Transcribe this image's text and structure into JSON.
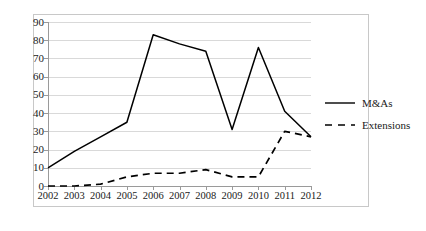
{
  "chart_data": {
    "type": "line",
    "title": "",
    "subtitle": "",
    "xlabel": "",
    "ylabel": "",
    "categories": [
      "2002",
      "2003",
      "2004",
      "2005",
      "2006",
      "2007",
      "2008",
      "2009",
      "2010",
      "2011",
      "2012"
    ],
    "series": [
      {
        "name": "M&As",
        "style": "solid",
        "color": "#000000",
        "values": [
          10,
          19,
          27,
          35,
          83,
          78,
          74,
          31,
          76,
          41,
          27
        ]
      },
      {
        "name": "Extensions",
        "style": "dashed",
        "color": "#000000",
        "values": [
          0,
          0,
          1,
          5,
          7,
          7,
          9,
          5,
          5,
          30,
          27
        ]
      }
    ],
    "ylim": [
      0,
      90
    ],
    "ytick_labels": [
      "0",
      "10",
      "20",
      "30",
      "40",
      "50",
      "60",
      "70",
      "80",
      "90"
    ],
    "ytick_values": [
      0,
      10,
      20,
      30,
      40,
      50,
      60,
      70,
      80,
      90
    ],
    "grid": true,
    "grid_axis": "y",
    "grid_color": "#d9d9d9",
    "legend_position": "right",
    "background": "#ffffff",
    "frame": true
  },
  "legend": {
    "entries": [
      {
        "label": "M&As",
        "style": "solid"
      },
      {
        "label": "Extensions",
        "style": "dashed"
      }
    ]
  }
}
